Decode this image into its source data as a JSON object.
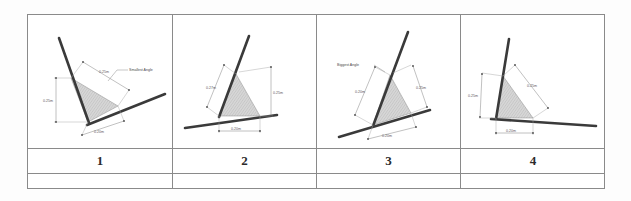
{
  "document": {
    "type": "geometry-worksheet-table",
    "background_color": "#ffffff",
    "border_color": "#8a8a8a"
  },
  "table": {
    "columns": 4,
    "rows": [
      "diagram-row",
      "number-row",
      "answer-row"
    ],
    "number_row_values": [
      "1",
      "2",
      "3",
      "4"
    ],
    "answer_row_values": [
      "",
      "",
      "",
      ""
    ]
  },
  "panels": [
    {
      "id": "panel-1",
      "number": "1",
      "annotation": "Smallest Angle",
      "dimensions": [
        {
          "name": "upper-right-side",
          "label": "0.25m"
        },
        {
          "name": "left-vertical-side",
          "label": "0.25m"
        },
        {
          "name": "bottom-side",
          "label": "0.20m"
        }
      ]
    },
    {
      "id": "panel-2",
      "number": "2",
      "annotation": "",
      "dimensions": [
        {
          "name": "upper-left-side",
          "label": "0.27m"
        },
        {
          "name": "right-vertical-side",
          "label": "0.25m"
        },
        {
          "name": "bottom-side",
          "label": "0.20m"
        }
      ]
    },
    {
      "id": "panel-3",
      "number": "3",
      "annotation": "Biggest Angle",
      "dimensions": [
        {
          "name": "upper-left-side",
          "label": "0.20m"
        },
        {
          "name": "right-side",
          "label": "0.25m"
        },
        {
          "name": "bottom-side",
          "label": "0.20m"
        }
      ]
    },
    {
      "id": "panel-4",
      "number": "4",
      "annotation": "",
      "dimensions": [
        {
          "name": "left-vertical-side",
          "label": "0.25m"
        },
        {
          "name": "upper-right-side",
          "label": "0.25m"
        },
        {
          "name": "bottom-side",
          "label": "0.20m"
        }
      ]
    }
  ],
  "colors": {
    "rod": "#3a3a3a",
    "triangle_fill": "#cfcfcf",
    "dimension_line": "#8e8e8e",
    "text": "#5b5b5b"
  }
}
